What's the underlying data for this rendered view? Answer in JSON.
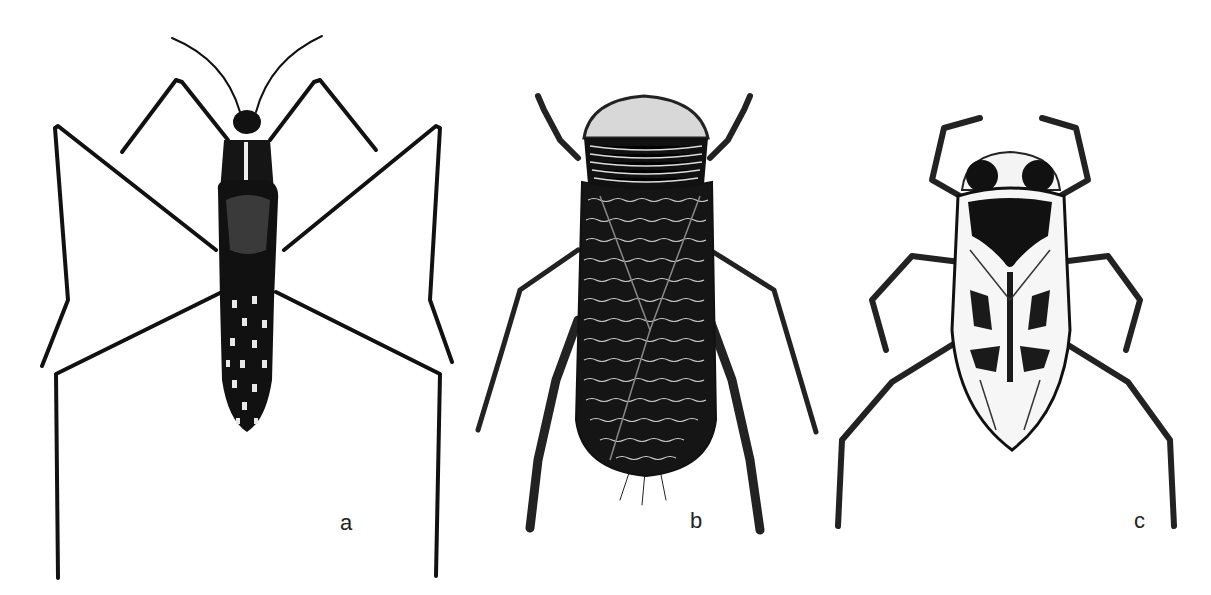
{
  "figure": {
    "background": "#ffffff",
    "ink_color": "#111111",
    "panels": [
      {
        "id": "a",
        "label": "a",
        "description": "Long-legged slender aquatic bug, dorsal view, dark body with pale spots"
      },
      {
        "id": "b",
        "label": "b",
        "description": "Oval water bug with striated pronotum and densely patterned wings, paddle-like hind legs"
      },
      {
        "id": "c",
        "label": "c",
        "description": "Backswimmer-like bug with large eyes, black pronotal mark and mottled wings"
      }
    ]
  }
}
